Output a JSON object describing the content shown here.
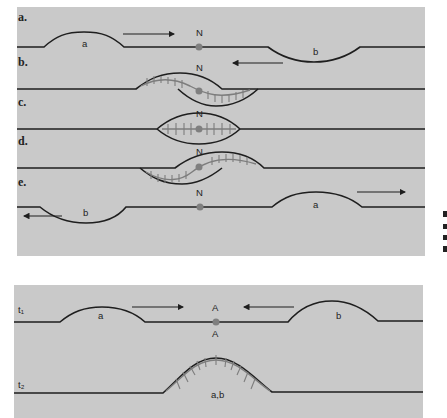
{
  "upper_panel": {
    "rows": [
      {
        "id": "a",
        "label": "a.",
        "origin_label": "N",
        "bubble_left": "a",
        "bubble_right": "b",
        "arrow_right": "→",
        "arrow_left": "←"
      },
      {
        "id": "b",
        "label": "b.",
        "origin_label": "N"
      },
      {
        "id": "c",
        "label": "c.",
        "origin_label": "N"
      },
      {
        "id": "d",
        "label": "d.",
        "origin_label": "N"
      },
      {
        "id": "e",
        "label": "e.",
        "origin_label": "N",
        "bubble_left": "b",
        "bubble_right": "a"
      }
    ]
  },
  "lower_panel": {
    "t1": {
      "label": "t₁",
      "bubble_left": "a",
      "bubble_right": "b",
      "site_label_top": "A",
      "site_label_bottom": "A"
    },
    "t2": {
      "label": "t₂",
      "merged_bubble": "a,b"
    }
  },
  "colors": {
    "panel_background": "#c9c9c9",
    "strand": "#1e1e1e",
    "new_strand": "#7d7d7d",
    "origin_dot": "#7f7f7f"
  }
}
